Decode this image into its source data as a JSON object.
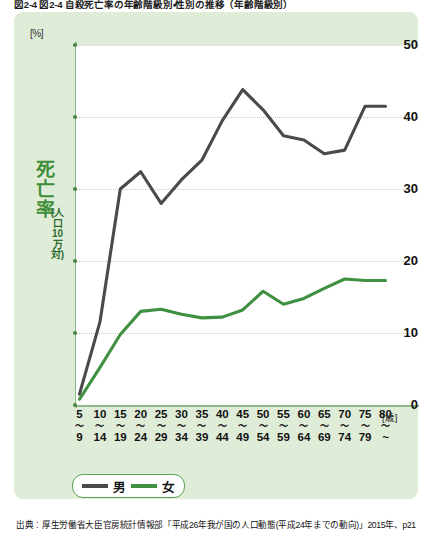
{
  "figure": {
    "title": "図2-4   図2-4 自殺死亡率の年齢階級別・性別の推移（年齢階級別）",
    "percent_unit": "[%]",
    "age_unit": "[歳]",
    "ylabel_main": "死亡率",
    "ylabel_sub": "(人口10万対)",
    "source": "出典：厚生労働省大臣官房統計情報部「平成26年我が国の人口動態(平成24年までの動向)」2015年、p21"
  },
  "legend": {
    "items": [
      {
        "label": "男",
        "color": "#4a4a4a"
      },
      {
        "label": "女",
        "color": "#3f9040"
      }
    ]
  },
  "chart_data": {
    "type": "line",
    "xlabel": "[歳]",
    "ylabel": "死亡率 (人口10万対)",
    "ylim": [
      0,
      50
    ],
    "yticks": [
      0,
      10,
      20,
      30,
      40,
      50
    ],
    "grid": true,
    "legend_position": "bottom-left",
    "categories": [
      "5\n9",
      "10\n14",
      "15\n19",
      "20\n24",
      "25\n29",
      "30\n34",
      "35\n39",
      "40\n44",
      "45\n49",
      "50\n54",
      "55\n59",
      "60\n64",
      "65\n69",
      "70\n74",
      "75\n79",
      "80\n~"
    ],
    "category_labels_top": [
      "5",
      "10",
      "15",
      "20",
      "25",
      "30",
      "35",
      "40",
      "45",
      "50",
      "55",
      "60",
      "65",
      "70",
      "75",
      "80"
    ],
    "category_labels_bottom": [
      "9",
      "14",
      "19",
      "24",
      "29",
      "34",
      "39",
      "44",
      "49",
      "54",
      "59",
      "64",
      "69",
      "74",
      "79",
      "~"
    ],
    "series": [
      {
        "name": "男",
        "color": "#4a4a4a",
        "values": [
          1.5,
          11.5,
          30.0,
          32.4,
          28.0,
          31.3,
          34.0,
          39.5,
          43.8,
          41.0,
          37.4,
          36.8,
          34.9,
          35.4,
          41.5,
          41.5
        ]
      },
      {
        "name": "女",
        "color": "#3f9040",
        "values": [
          0.8,
          5.2,
          9.8,
          13.0,
          13.3,
          12.6,
          12.1,
          12.2,
          13.2,
          15.8,
          14.0,
          14.8,
          16.2,
          17.5,
          17.3,
          17.3
        ]
      }
    ]
  }
}
